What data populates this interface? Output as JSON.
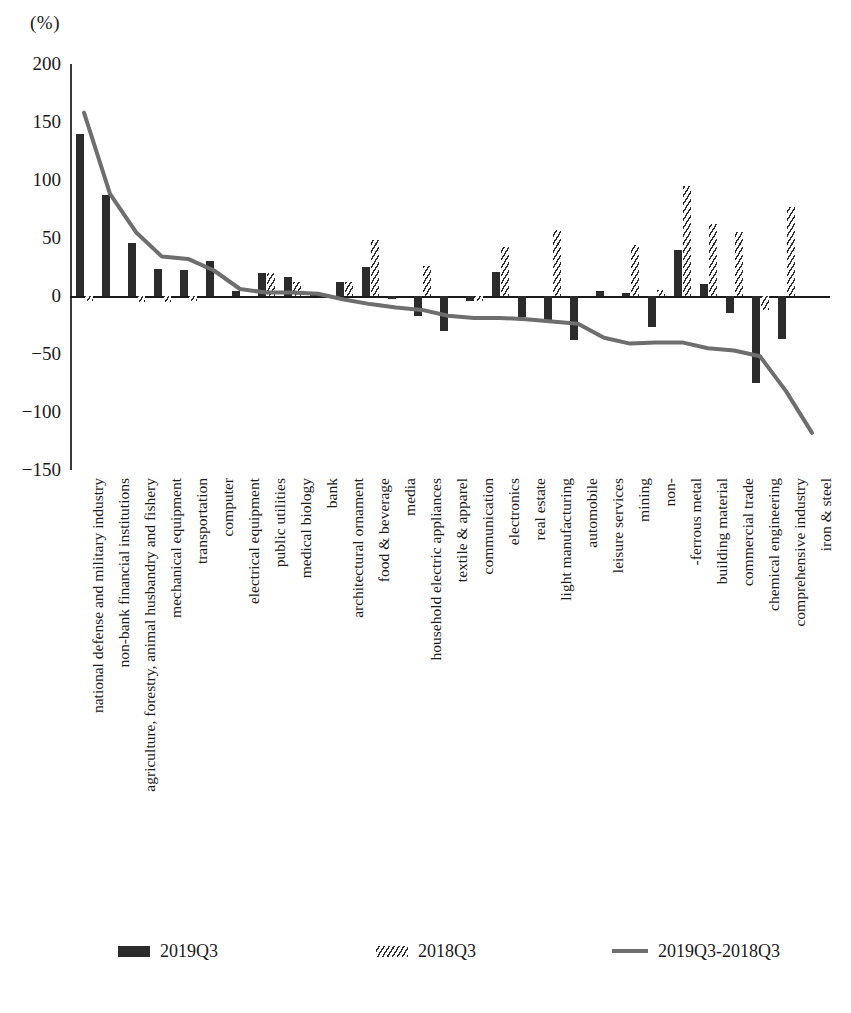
{
  "unit_label": "(%)",
  "legend": {
    "items": [
      {
        "label": "2019Q3",
        "marker": "solid-bar-swatch",
        "color": "#2b2b2b"
      },
      {
        "label": "2018Q3",
        "marker": "hatched-bar-swatch",
        "color": "#2f2f2f"
      },
      {
        "label": "2019Q3-2018Q3",
        "marker": "line-swatch",
        "color": "#6e6e6e"
      }
    ]
  },
  "chart_data": {
    "type": "bar",
    "title": "",
    "subtitle": "",
    "xlabel": "",
    "ylabel": "(%)",
    "ylim": [
      -150,
      200
    ],
    "yticks": [
      200,
      150,
      100,
      50,
      0,
      -50,
      -100,
      -150
    ],
    "ytick_labels": [
      "200",
      "150",
      "100",
      "50",
      "0",
      "−50",
      "−100",
      "−150"
    ],
    "grid": false,
    "legend_position": "bottom",
    "categories": [
      "national defense and military industry",
      "non-bank financial institutions",
      "agriculture, forestry, animal husbandry and fishery",
      "mechanical equipment",
      "transportation",
      "computer",
      "electrical equipment",
      "public utilities",
      "medical biology",
      "bank",
      "architectural ornament",
      "food & beverage",
      "media",
      "household electric appliances",
      "textile & apparel",
      "communication",
      "electronics",
      "real estate",
      "light manufacturing",
      "automobile",
      "leisure services",
      "mining",
      "non-",
      "-ferrous metal",
      "building material",
      "commercial trade",
      "chemical engineering",
      "comprehensive industry",
      "iron & steel"
    ],
    "series": [
      {
        "name": "2019Q3",
        "style": "solid-bar",
        "color": "#2b2b2b",
        "values": [
          140,
          87,
          46,
          23,
          22,
          30,
          4,
          20,
          16,
          2,
          12,
          25,
          -3,
          -17,
          -30,
          -4,
          21,
          -18,
          -21,
          -38,
          4,
          3,
          -27,
          40,
          10,
          -15,
          -75,
          -37,
          0
        ]
      },
      {
        "name": "2018Q3",
        "style": "hatched-bar",
        "color": "#2f2f2f",
        "values": [
          -4,
          0,
          -5,
          -5,
          -4,
          0,
          0,
          20,
          12,
          0,
          12,
          48,
          0,
          26,
          0,
          -4,
          42,
          0,
          57,
          0,
          0,
          44,
          5,
          95,
          62,
          55,
          -12,
          77,
          0
        ]
      }
    ],
    "line_series": {
      "name": "2019Q3-2018Q3",
      "style": "line",
      "color": "#6e6e6e",
      "values": [
        158,
        88,
        55,
        34,
        32,
        22,
        6,
        3,
        3,
        2,
        -3,
        -7,
        -10,
        -12,
        -17,
        -19,
        -19,
        -20,
        -22,
        -24,
        -36,
        -41,
        -40,
        -40,
        -45,
        -47,
        -52,
        -82,
        -118
      ]
    }
  }
}
